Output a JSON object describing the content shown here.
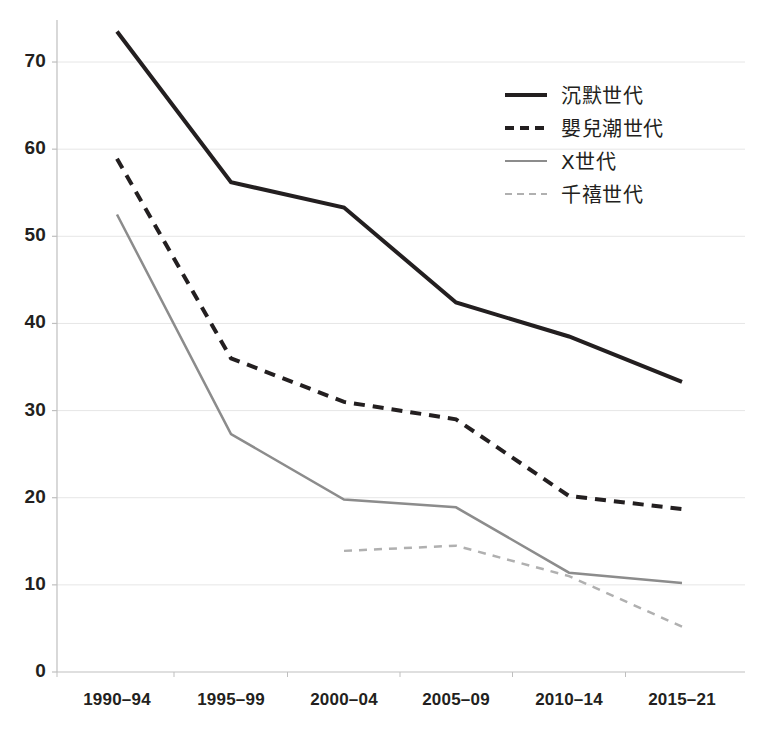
{
  "chart_data": {
    "type": "line",
    "title": "",
    "subtitle": "",
    "xlabel": "",
    "ylabel": "",
    "categories": [
      "1990–94",
      "1995–99",
      "2000–04",
      "2005–09",
      "2010–14",
      "2015–21"
    ],
    "ylim": [
      0,
      75
    ],
    "yticks": [
      0,
      10,
      20,
      30,
      40,
      50,
      60,
      70
    ],
    "ytick_labels": [
      "0",
      "10",
      "20",
      "30",
      "40",
      "50",
      "60",
      "70"
    ],
    "grid": "horizontal",
    "legend_position": "upper-right",
    "series": [
      {
        "name": "沉默世代",
        "style": "solid",
        "color": "#231f20",
        "width": 4,
        "values": [
          73.5,
          56.2,
          53.3,
          42.4,
          38.5,
          33.3
        ]
      },
      {
        "name": "嬰兒潮世代",
        "style": "dashed",
        "color": "#231f20",
        "width": 4,
        "values": [
          58.9,
          36.0,
          31.0,
          29.0,
          20.2,
          18.7
        ]
      },
      {
        "name": "X世代",
        "style": "solid",
        "color": "#8c8c8c",
        "width": 2.5,
        "values": [
          52.5,
          27.3,
          19.8,
          18.9,
          11.4,
          10.2
        ]
      },
      {
        "name": "千禧世代",
        "style": "dashed",
        "color": "#b0b0b0",
        "width": 2.5,
        "values": [
          null,
          null,
          13.9,
          14.5,
          11.0,
          5.2
        ]
      }
    ]
  },
  "axis": {
    "y_labels": [
      "70",
      "60",
      "50",
      "40",
      "30",
      "20",
      "10",
      "0"
    ],
    "x_labels": [
      "1990–94",
      "1995–99",
      "2000–04",
      "2005–09",
      "2010–14",
      "2015–21"
    ]
  },
  "legend": {
    "items": [
      {
        "label": "沉默世代",
        "style": "solid",
        "color": "#231f20",
        "thickness": "4px"
      },
      {
        "label": "嬰兒潮世代",
        "style": "dashed",
        "color": "#231f20",
        "thickness": "4px"
      },
      {
        "label": "X世代",
        "style": "solid",
        "color": "#8c8c8c",
        "thickness": "2px"
      },
      {
        "label": "千禧世代",
        "style": "dashed",
        "color": "#b0b0b0",
        "thickness": "2px"
      }
    ]
  },
  "colors": {
    "gridline": "#e6e6e6",
    "axis": "#bfbfbf",
    "text": "#231f20",
    "silent": "#231f20",
    "boomer": "#231f20",
    "genx": "#8c8c8c",
    "millennial": "#b0b0b0"
  }
}
